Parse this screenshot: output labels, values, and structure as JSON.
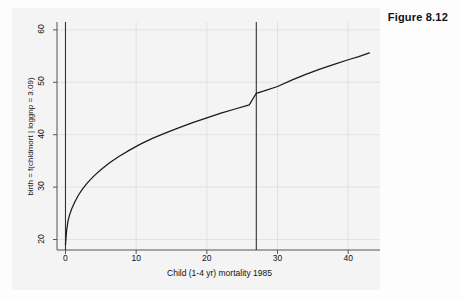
{
  "figure": {
    "caption": "Figure 8.12"
  },
  "chart_data": {
    "type": "line",
    "title": "",
    "subtitle": "",
    "xlabel": "Child (1-4 yr) mortality 1985",
    "ylabel": "birth = f(chldmort | loggnp = 3.09)",
    "xlim": [
      -1.2,
      44.5
    ],
    "ylim": [
      18.0,
      61.5
    ],
    "xticks": [
      0,
      10,
      20,
      30,
      40
    ],
    "xtick_labels": [
      "0",
      "10",
      "20",
      "30",
      "40"
    ],
    "yticks": [
      20,
      30,
      40,
      50,
      60
    ],
    "ytick_labels": [
      "20",
      "30",
      "40",
      "50",
      "60"
    ],
    "grid": true,
    "grid_color": "#e2e2e2",
    "legend": null,
    "legend_position": "none",
    "line_color": "#1a1a1a",
    "axis_color": "#555555",
    "background_color": "#ffffff",
    "reference_lines": [
      {
        "name": "x-zero-reference-line",
        "orientation": "vertical",
        "x": 0.0,
        "color": "#333333"
      },
      {
        "name": "x-mean-reference-line",
        "orientation": "vertical",
        "x": 27.0,
        "color": "#333333"
      }
    ],
    "series": [
      {
        "name": "birth = f(chldmort | loggnp = 3.09)",
        "x": [
          0.0,
          0.15,
          0.35,
          0.6,
          0.9,
          1.3,
          1.8,
          2.4,
          3.1,
          4.0,
          5.0,
          6.2,
          7.5,
          9.0,
          10.6,
          12.3,
          14.1,
          16.0,
          18.0,
          20.0,
          22.0,
          24.0,
          26.0,
          27.0,
          28.0,
          30.0,
          32.0,
          34.0,
          36.0,
          38.0,
          40.0,
          41.5,
          43.0
        ],
        "y": [
          19.0,
          21.6,
          23.5,
          24.8,
          25.9,
          27.1,
          28.4,
          29.6,
          30.8,
          32.1,
          33.3,
          34.6,
          35.8,
          37.0,
          38.2,
          39.3,
          40.3,
          41.3,
          42.3,
          43.2,
          44.1,
          44.9,
          45.7,
          47.9,
          48.3,
          49.2,
          50.4,
          51.5,
          52.5,
          53.4,
          54.3,
          54.9,
          55.6
        ]
      }
    ]
  }
}
